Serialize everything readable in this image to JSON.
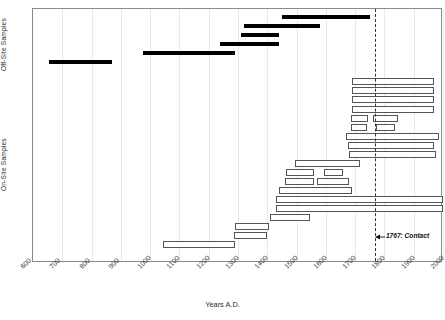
{
  "chart_data": {
    "type": "bar",
    "orientation": "horizontal-ranges",
    "title": "",
    "xlabel": "Years A.D.",
    "ylabel": "",
    "xlim": [
      600,
      2000
    ],
    "xticks": [
      600,
      700,
      800,
      900,
      1000,
      1100,
      1200,
      1300,
      1400,
      1500,
      1600,
      1700,
      1800,
      1900,
      2000
    ],
    "xtick_labels": [
      "600",
      "700",
      "800",
      "900",
      "1000",
      "1100",
      "1200",
      "1300",
      "1400",
      "1500",
      "1600",
      "1700",
      "1800",
      "1900",
      "2000"
    ],
    "grid": true,
    "legend": "none",
    "group_labels": {
      "off_site": "Off-Site Samples",
      "on_site": "On-Site Samples"
    },
    "annotations": [
      {
        "name": "contact-line",
        "type": "vline",
        "x": 1767,
        "style": "dashed",
        "label": "1767: Contact",
        "label_x": 1805,
        "label_y_row": 25
      }
    ],
    "series": [
      {
        "name": "Off-Site Samples",
        "style": "filled",
        "color": "#000000",
        "ranges": [
          {
            "row": 0,
            "start": 1450,
            "end": 1750
          },
          {
            "row": 1,
            "start": 1320,
            "end": 1580
          },
          {
            "row": 2,
            "start": 1310,
            "end": 1440
          },
          {
            "row": 3,
            "start": 1240,
            "end": 1440
          },
          {
            "row": 4,
            "start": 975,
            "end": 1290
          },
          {
            "row": 5,
            "start": 655,
            "end": 870
          }
        ]
      },
      {
        "name": "On-Site Samples",
        "style": "outlined",
        "color": "#ffffff",
        "edgecolor": "#555555",
        "ranges": [
          {
            "row": 7,
            "start": 1690,
            "end": 1970
          },
          {
            "row": 8,
            "start": 1690,
            "end": 1970
          },
          {
            "row": 9,
            "start": 1690,
            "end": 1970
          },
          {
            "row": 10,
            "start": 1690,
            "end": 1970
          },
          {
            "row": 11,
            "start": 1685,
            "end": 1745
          },
          {
            "row": 11,
            "start": 1760,
            "end": 1845
          },
          {
            "row": 12,
            "start": 1685,
            "end": 1740
          },
          {
            "row": 12,
            "start": 1770,
            "end": 1835
          },
          {
            "row": 13,
            "start": 1670,
            "end": 1985
          },
          {
            "row": 14,
            "start": 1675,
            "end": 1970
          },
          {
            "row": 15,
            "start": 1680,
            "end": 1975
          },
          {
            "row": 16,
            "start": 1495,
            "end": 1715
          },
          {
            "row": 17,
            "start": 1465,
            "end": 1560
          },
          {
            "row": 17,
            "start": 1595,
            "end": 1660
          },
          {
            "row": 18,
            "start": 1460,
            "end": 1560
          },
          {
            "row": 18,
            "start": 1570,
            "end": 1680
          },
          {
            "row": 19,
            "start": 1440,
            "end": 1690
          },
          {
            "row": 20,
            "start": 1430,
            "end": 2000
          },
          {
            "row": 21,
            "start": 1430,
            "end": 2000
          },
          {
            "row": 22,
            "start": 1410,
            "end": 1545
          },
          {
            "row": 23,
            "start": 1290,
            "end": 1405
          },
          {
            "row": 24,
            "start": 1285,
            "end": 1400
          },
          {
            "row": 25,
            "start": 1045,
            "end": 1290
          }
        ]
      }
    ]
  }
}
